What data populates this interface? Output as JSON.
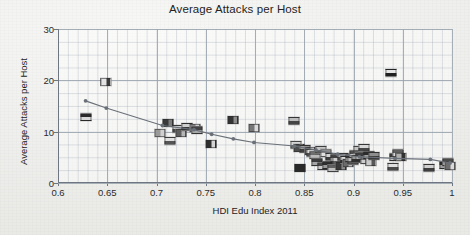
{
  "chart_data": {
    "type": "scatter",
    "title": "Average Attacks per Host",
    "xlabel": "HDI Edu Index 2011",
    "ylabel": "Average Attacks per Host",
    "xlim": [
      0.6,
      1.0
    ],
    "ylim": [
      0,
      30
    ],
    "xticks": [
      "0.6",
      "0.65",
      "0.7",
      "0.75",
      "0.8",
      "0.85",
      "0.9",
      "0.95",
      "1"
    ],
    "xtick_values": [
      0.6,
      0.65,
      0.7,
      0.75,
      0.8,
      0.85,
      0.9,
      0.95,
      1.0
    ],
    "yticks": [
      "0",
      "10",
      "20",
      "30"
    ],
    "ytick_values": [
      0,
      10,
      20,
      30
    ],
    "grid": true,
    "minor_grid": true,
    "legend": "none",
    "marker_style": "country-flag-icons",
    "points": [
      {
        "x": 0.628,
        "y": 12.9,
        "flag": [
          "#2a2a2a",
          "#d8d8d8"
        ]
      },
      {
        "x": 0.649,
        "y": 19.6,
        "flag": [
          "#e4e4e4",
          "#3a3a3a"
        ]
      },
      {
        "x": 0.704,
        "y": 9.7,
        "flag": [
          "#9a9a9a",
          "#d0d0d0"
        ]
      },
      {
        "x": 0.712,
        "y": 11.7,
        "flag": [
          "#3a3a3a",
          "#7d7d7d"
        ]
      },
      {
        "x": 0.714,
        "y": 8.2,
        "flag": [
          "#e0e0e0",
          "#555555"
        ]
      },
      {
        "x": 0.722,
        "y": 10.6,
        "flag": [
          "#c9c9c9",
          "#4a4a4a"
        ]
      },
      {
        "x": 0.725,
        "y": 9.8,
        "flag": [
          "#5e5e5e",
          "#b6b6b6"
        ]
      },
      {
        "x": 0.731,
        "y": 11.0,
        "flag": [
          "#cfcfcf",
          "#383838"
        ]
      },
      {
        "x": 0.739,
        "y": 10.8,
        "flag": [
          "#8e8e8e",
          "#e2e2e2"
        ]
      },
      {
        "x": 0.741,
        "y": 10.4,
        "flag": [
          "#434343",
          "#a8a8a8"
        ]
      },
      {
        "x": 0.755,
        "y": 7.6,
        "flag": [
          "#2f2f2f",
          "#d4d4d4"
        ]
      },
      {
        "x": 0.778,
        "y": 12.3,
        "flag": [
          "#333333",
          "#8c8c8c"
        ]
      },
      {
        "x": 0.799,
        "y": 10.8,
        "flag": [
          "#777777",
          "#dcdcdc"
        ]
      },
      {
        "x": 0.84,
        "y": 12.1,
        "flag": [
          "#bcbcbc",
          "#454545"
        ]
      },
      {
        "x": 0.842,
        "y": 7.5,
        "flag": [
          "#d6d6d6",
          "#6a6a6a"
        ]
      },
      {
        "x": 0.845,
        "y": 6.9,
        "flag": [
          "#4d4d4d",
          "#c2c2c2"
        ]
      },
      {
        "x": 0.846,
        "y": 3.0,
        "flag": [
          "#2a2a2a",
          "#2a2a2a"
        ]
      },
      {
        "x": 0.851,
        "y": 6.6,
        "flag": [
          "#9e9e9e",
          "#3f3f3f"
        ]
      },
      {
        "x": 0.856,
        "y": 6.3,
        "flag": [
          "#5a5a5a",
          "#cfcfcf"
        ]
      },
      {
        "x": 0.858,
        "y": 5.8,
        "flag": [
          "#dadada",
          "#4f4f4f"
        ]
      },
      {
        "x": 0.861,
        "y": 5.4,
        "flag": [
          "#6d6d6d",
          "#b9b9b9"
        ]
      },
      {
        "x": 0.863,
        "y": 4.0,
        "flag": [
          "#3c3c3c",
          "#a5a5a5"
        ]
      },
      {
        "x": 0.867,
        "y": 6.5,
        "flag": [
          "#c6c6c6",
          "#575757"
        ]
      },
      {
        "x": 0.869,
        "y": 3.3,
        "flag": [
          "#484848",
          "#cacaca"
        ]
      },
      {
        "x": 0.872,
        "y": 5.9,
        "flag": [
          "#8a8a8a",
          "#e0e0e0"
        ]
      },
      {
        "x": 0.874,
        "y": 3.6,
        "flag": [
          "#2e2e2e",
          "#9b9b9b"
        ]
      },
      {
        "x": 0.877,
        "y": 5.1,
        "flag": [
          "#d2d2d2",
          "#3a3a3a"
        ]
      },
      {
        "x": 0.879,
        "y": 2.9,
        "flag": [
          "#606060",
          "#c0c0c0"
        ]
      },
      {
        "x": 0.882,
        "y": 4.8,
        "flag": [
          "#454545",
          "#b2b2b2"
        ]
      },
      {
        "x": 0.884,
        "y": 4.3,
        "flag": [
          "#cdcdcd",
          "#5d5d5d"
        ]
      },
      {
        "x": 0.887,
        "y": 3.4,
        "flag": [
          "#393939",
          "#8f8f8f"
        ]
      },
      {
        "x": 0.889,
        "y": 5.0,
        "flag": [
          "#a0a0a0",
          "#4c4c4c"
        ]
      },
      {
        "x": 0.892,
        "y": 4.4,
        "flag": [
          "#dcdcdc",
          "#2f2f2f"
        ]
      },
      {
        "x": 0.894,
        "y": 3.9,
        "flag": [
          "#6b6b6b",
          "#c8c8c8"
        ]
      },
      {
        "x": 0.897,
        "y": 4.9,
        "flag": [
          "#353535",
          "#adadad"
        ]
      },
      {
        "x": 0.899,
        "y": 4.2,
        "flag": [
          "#bdbdbd",
          "#525252"
        ]
      },
      {
        "x": 0.902,
        "y": 5.6,
        "flag": [
          "#4e4e4e",
          "#d6d6d6"
        ]
      },
      {
        "x": 0.904,
        "y": 4.6,
        "flag": [
          "#969696",
          "#313131"
        ]
      },
      {
        "x": 0.906,
        "y": 6.4,
        "flag": [
          "#c4c4c4",
          "#666666"
        ]
      },
      {
        "x": 0.908,
        "y": 5.2,
        "flag": [
          "#3d3d3d",
          "#b5b5b5"
        ]
      },
      {
        "x": 0.911,
        "y": 6.8,
        "flag": [
          "#d8d8d8",
          "#474747"
        ]
      },
      {
        "x": 0.913,
        "y": 4.5,
        "flag": [
          "#717171",
          "#cdcdcd"
        ]
      },
      {
        "x": 0.916,
        "y": 5.5,
        "flag": [
          "#2c2c2c",
          "#a2a2a2"
        ]
      },
      {
        "x": 0.918,
        "y": 4.1,
        "flag": [
          "#cacaca",
          "#585858"
        ]
      },
      {
        "x": 0.921,
        "y": 5.3,
        "flag": [
          "#8d8d8d",
          "#3b3b3b"
        ]
      },
      {
        "x": 0.938,
        "y": 21.5,
        "flag": [
          "#e6e6e6",
          "#1f1f1f"
        ]
      },
      {
        "x": 0.94,
        "y": 3.1,
        "flag": [
          "#dedede",
          "#4a4a4a"
        ]
      },
      {
        "x": 0.942,
        "y": 5.1,
        "flag": [
          "#3a3a3a",
          "#c3c3c3"
        ]
      },
      {
        "x": 0.945,
        "y": 5.9,
        "flag": [
          "#5f5f5f",
          "#d9d9d9"
        ]
      },
      {
        "x": 0.948,
        "y": 5.0,
        "flag": [
          "#b0b0b0",
          "#333333"
        ]
      },
      {
        "x": 0.977,
        "y": 3.0,
        "flag": [
          "#d0d0d0",
          "#3e3e3e"
        ]
      },
      {
        "x": 0.993,
        "y": 3.6,
        "flag": [
          "#2b2b2b",
          "#9f9f9f"
        ]
      },
      {
        "x": 0.996,
        "y": 4.0,
        "flag": [
          "#4b4b4b",
          "#c7c7c7"
        ]
      },
      {
        "x": 0.998,
        "y": 3.3,
        "flag": [
          "#6c6c6c",
          "#dadada"
        ]
      }
    ],
    "trend_line": {
      "name": "fitted trend",
      "color": "#6a7078",
      "marker": "dot",
      "x": [
        0.628,
        0.649,
        0.706,
        0.738,
        0.756,
        0.778,
        0.799,
        0.84,
        0.862,
        0.884,
        0.906,
        0.942,
        0.978,
        0.998
      ],
      "y": [
        16.0,
        14.6,
        11.2,
        10.4,
        9.5,
        8.6,
        7.9,
        7.2,
        6.4,
        5.6,
        5.1,
        4.8,
        4.6,
        3.9
      ]
    }
  }
}
